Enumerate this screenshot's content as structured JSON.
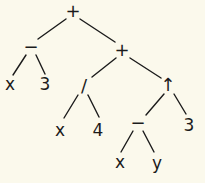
{
  "diagram": {
    "type": "expression-tree",
    "expression": "(x - 3) + ((x / 4) + ((x - y) ↑ 3))",
    "colors": {
      "background": "#fbf9ec",
      "ink": "#1b1b1b"
    },
    "nodes": [
      {
        "id": "n0",
        "label": "+",
        "x": 73,
        "y": 11,
        "kind": "operator"
      },
      {
        "id": "n1",
        "label": "−",
        "x": 31,
        "y": 47,
        "kind": "operator"
      },
      {
        "id": "n2",
        "label": "+",
        "x": 122,
        "y": 50,
        "kind": "operator"
      },
      {
        "id": "n3",
        "label": "x",
        "x": 10,
        "y": 84,
        "kind": "operand"
      },
      {
        "id": "n4",
        "label": "3",
        "x": 45,
        "y": 84,
        "kind": "operand"
      },
      {
        "id": "n5",
        "label": "/",
        "x": 84,
        "y": 86,
        "kind": "operator"
      },
      {
        "id": "n6",
        "label": "↑",
        "x": 168,
        "y": 85,
        "kind": "operator"
      },
      {
        "id": "n7",
        "label": "x",
        "x": 60,
        "y": 130,
        "kind": "operand"
      },
      {
        "id": "n8",
        "label": "4",
        "x": 98,
        "y": 130,
        "kind": "operand"
      },
      {
        "id": "n9",
        "label": "−",
        "x": 138,
        "y": 123,
        "kind": "operator"
      },
      {
        "id": "n10",
        "label": "3",
        "x": 189,
        "y": 125,
        "kind": "operand"
      },
      {
        "id": "n11",
        "label": "x",
        "x": 120,
        "y": 162,
        "kind": "operand"
      },
      {
        "id": "n12",
        "label": "y",
        "x": 157,
        "y": 163,
        "kind": "operand"
      }
    ],
    "edges": [
      {
        "from": "n0",
        "to": "n1",
        "x1": 66,
        "y1": 19,
        "x2": 38,
        "y2": 39
      },
      {
        "from": "n0",
        "to": "n2",
        "x1": 80,
        "y1": 19,
        "x2": 115,
        "y2": 42
      },
      {
        "from": "n1",
        "to": "n3",
        "x1": 26,
        "y1": 55,
        "x2": 13,
        "y2": 75
      },
      {
        "from": "n1",
        "to": "n4",
        "x1": 36,
        "y1": 55,
        "x2": 45,
        "y2": 74
      },
      {
        "from": "n2",
        "to": "n5",
        "x1": 116,
        "y1": 58,
        "x2": 92,
        "y2": 77
      },
      {
        "from": "n2",
        "to": "n6",
        "x1": 130,
        "y1": 58,
        "x2": 161,
        "y2": 78
      },
      {
        "from": "n5",
        "to": "n7",
        "x1": 78,
        "y1": 95,
        "x2": 64,
        "y2": 118
      },
      {
        "from": "n5",
        "to": "n8",
        "x1": 88,
        "y1": 95,
        "x2": 99,
        "y2": 117
      },
      {
        "from": "n6",
        "to": "n9",
        "x1": 164,
        "y1": 94,
        "x2": 146,
        "y2": 115
      },
      {
        "from": "n6",
        "to": "n10",
        "x1": 174,
        "y1": 94,
        "x2": 186,
        "y2": 114
      },
      {
        "from": "n9",
        "to": "n11",
        "x1": 133,
        "y1": 131,
        "x2": 121,
        "y2": 152
      },
      {
        "from": "n9",
        "to": "n12",
        "x1": 143,
        "y1": 131,
        "x2": 154,
        "y2": 152
      }
    ]
  }
}
